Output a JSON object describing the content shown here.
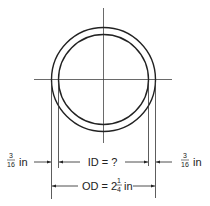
{
  "figure": {
    "colors": {
      "line": "#222222",
      "centerline": "#444444",
      "background": "#ffffff"
    }
  },
  "labels": {
    "left_thickness": {
      "numerator": "3",
      "denominator": "16",
      "unit": "in"
    },
    "right_thickness": {
      "numerator": "3",
      "denominator": "16",
      "unit": "in"
    },
    "inner_diameter": {
      "text": "ID = ?"
    },
    "outer_diameter": {
      "prefix": "OD = 2",
      "numerator": "1",
      "denominator": "4",
      "unit": "in"
    }
  },
  "geometry": {
    "center": [
      103,
      79
    ],
    "outer_radius": 52,
    "inner_radius": 45
  }
}
